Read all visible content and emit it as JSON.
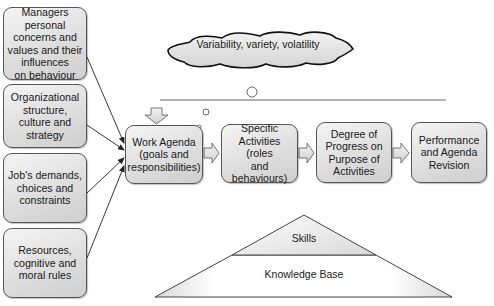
{
  "influences": [
    {
      "label": "Managers\npersonal\nconcerns and\nvalues and their\ninfluences\non behaviour"
    },
    {
      "label": "Organizational\nstructure,\nculture and\nstrategy"
    },
    {
      "label": "Job's demands,\nchoices and\nconstraints"
    },
    {
      "label": "Resources,\ncognitive and\nmoral rules"
    }
  ],
  "cloud": {
    "label": "Variability, variety, volatility"
  },
  "process": [
    {
      "label": "Work Agenda\n(goals and\nresponsibilities)"
    },
    {
      "label": "Specific\nActivities (roles\nand behaviours)"
    },
    {
      "label": "Degree of\nProgress on\nPurpose of\nActivities"
    },
    {
      "label": "Performance\nand Agenda\nRevision"
    }
  ],
  "pyramid": {
    "top": "Skills",
    "base": "Knowledge Base"
  },
  "colors": {
    "box_fill": "#dcdcdc",
    "stroke": "#555555",
    "cloud_fill": "#dedede"
  }
}
